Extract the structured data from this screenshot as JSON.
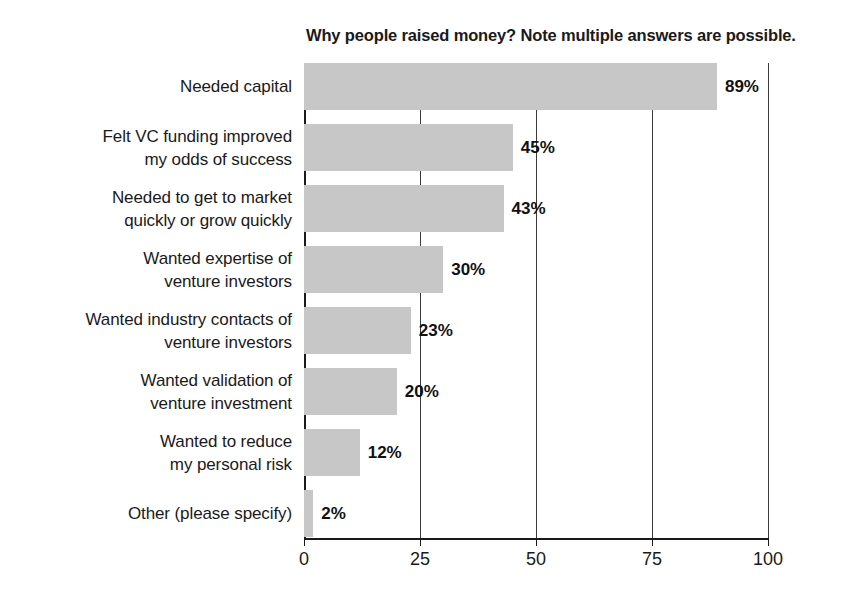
{
  "chart_data": {
    "type": "bar",
    "orientation": "horizontal",
    "title": "Why people raised money? Note multiple answers are possible.",
    "xlabel": "",
    "ylabel": "",
    "xlim": [
      0,
      100
    ],
    "xticks": [
      0,
      25,
      50,
      75,
      100
    ],
    "xtick_labels": [
      "0",
      "25",
      "50",
      "75",
      "100"
    ],
    "grid": "vertical",
    "legend": "none",
    "bar_color": "#c7c7c7",
    "categories": [
      "Needed capital",
      "Felt VC funding improved\nmy odds of success",
      "Needed to get to market\nquickly or grow quickly",
      "Wanted expertise of\nventure investors",
      "Wanted industry contacts of\nventure investors",
      "Wanted validation of\nventure investment",
      "Wanted to reduce\nmy personal risk",
      "Other (please specify)"
    ],
    "values": [
      89,
      45,
      43,
      30,
      23,
      20,
      12,
      2
    ],
    "value_labels": [
      "89%",
      "45%",
      "43%",
      "30%",
      "23%",
      "20%",
      "12%",
      "2%"
    ]
  }
}
